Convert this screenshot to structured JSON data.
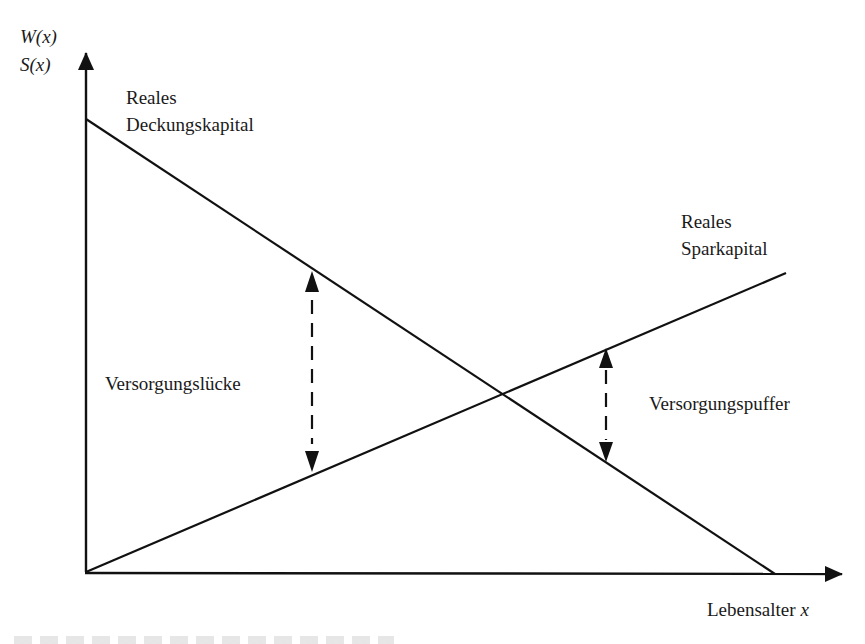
{
  "diagram": {
    "y_axis_label_line1": "W(x)",
    "y_axis_label_line2": "S(x)",
    "x_axis_label_text": "Lebensalter ",
    "x_axis_label_var": "x",
    "deckungskapital_label_line1": "Reales",
    "deckungskapital_label_line2": "Deckungskapital",
    "sparkapital_label_line1": "Reales",
    "sparkapital_label_line2": "Sparkapital",
    "gap_label": "Versorgungslücke",
    "buffer_label": "Versorgungspuffer",
    "line_color": "#111111",
    "background": "#ffffff"
  },
  "geometry": {
    "origin": [
      85,
      572
    ],
    "y_axis_tip": [
      86,
      53
    ],
    "x_axis_tip": [
      842,
      574
    ],
    "deckungskapital_line": {
      "from": [
        86,
        119
      ],
      "to": [
        775,
        574
      ]
    },
    "sparkapital_line": {
      "from": [
        86,
        572
      ],
      "to": [
        786,
        273
      ]
    },
    "intersection": [
      502,
      394
    ],
    "gap_arrow": {
      "x": 312,
      "y_top": 271,
      "y_bottom": 472
    },
    "buffer_arrow": {
      "x": 606,
      "y_top": 348,
      "y_bottom": 462
    }
  }
}
